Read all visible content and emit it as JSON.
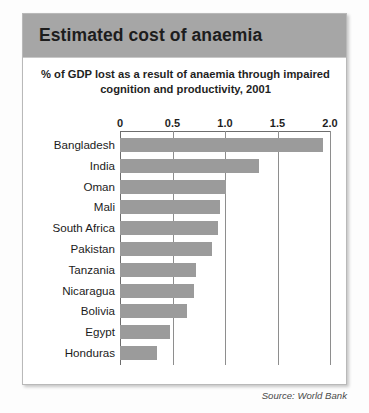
{
  "header": {
    "title": "Estimated cost of anaemia"
  },
  "source_note": "Source: World Bank",
  "chart_data": {
    "type": "bar",
    "orientation": "horizontal",
    "title": "Estimated cost of anaemia",
    "subtitle": "% of GDP lost as a result of anaemia through impaired cognition and productivity, 2001",
    "xlabel": "",
    "ylabel": "",
    "xlim": [
      0,
      2.0
    ],
    "xticks": [
      0,
      0.5,
      1.0,
      1.5,
      2.0
    ],
    "xtick_labels": [
      "0",
      "0.5",
      "1.0",
      "1.5",
      "2.0"
    ],
    "grid": true,
    "legend": false,
    "bar_color": "#9b9b9b",
    "categories": [
      "Bangladesh",
      "India",
      "Oman",
      "Mali",
      "South Africa",
      "Pakistan",
      "Tanzania",
      "Nicaragua",
      "Bolivia",
      "Egypt",
      "Honduras"
    ],
    "values": [
      1.93,
      1.32,
      1.01,
      0.95,
      0.93,
      0.88,
      0.72,
      0.7,
      0.64,
      0.48,
      0.35
    ]
  }
}
